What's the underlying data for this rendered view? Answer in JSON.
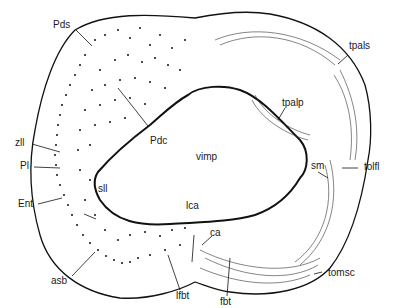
{
  "diagram": {
    "type": "anatomical cross-section",
    "colors": {
      "outline": "#111111",
      "dots": "#111111",
      "background": "#ffffff"
    },
    "labels": {
      "pds": "Pds",
      "pdc": "Pdc",
      "zll": "zll",
      "pl": "Pl",
      "ent": "Ent",
      "sll": "sll",
      "asb": "asb",
      "vimp": "vimp",
      "lca": "lca",
      "ca": "ca",
      "lfbt": "lfbt",
      "fbt": "fbt",
      "tpals": "tpals",
      "tpalp": "tpalp",
      "sm": "sm",
      "tolfl": "tolfl",
      "tomsc": "tomsc"
    }
  }
}
